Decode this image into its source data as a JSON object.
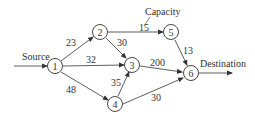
{
  "diagram": {
    "type": "network-flow",
    "labels": {
      "source": "Source",
      "destination": "Destination",
      "capacity": "Capacity"
    },
    "nodes": [
      {
        "id": "1",
        "label": "1"
      },
      {
        "id": "2",
        "label": "2"
      },
      {
        "id": "3",
        "label": "3"
      },
      {
        "id": "4",
        "label": "4"
      },
      {
        "id": "5",
        "label": "5"
      },
      {
        "id": "6",
        "label": "6"
      }
    ],
    "edges": [
      {
        "from": "1",
        "to": "2",
        "capacity": "23"
      },
      {
        "from": "1",
        "to": "3",
        "capacity": "32"
      },
      {
        "from": "1",
        "to": "4",
        "capacity": "48"
      },
      {
        "from": "2",
        "to": "5",
        "capacity": "15"
      },
      {
        "from": "2",
        "to": "3",
        "capacity": "30"
      },
      {
        "from": "4",
        "to": "3",
        "capacity": "35"
      },
      {
        "from": "3",
        "to": "6",
        "capacity": "200"
      },
      {
        "from": "5",
        "to": "6",
        "capacity": "13"
      },
      {
        "from": "4",
        "to": "6",
        "capacity": "30"
      }
    ]
  }
}
